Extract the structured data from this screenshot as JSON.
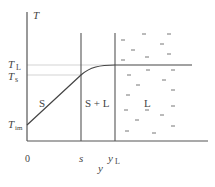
{
  "diagram": {
    "axes": {
      "y_axis_label": "T",
      "x_axis_label": "y",
      "origin_label": "0"
    },
    "y_ticks": [
      {
        "main": "T",
        "sub": "L",
        "meaning": "liquidus temperature"
      },
      {
        "main": "T",
        "sub": "s",
        "meaning": "solidus temperature"
      },
      {
        "main": "T",
        "sub": "im",
        "meaning": "initial/interface temperature"
      }
    ],
    "x_ticks": [
      {
        "main": "s",
        "sub": ""
      },
      {
        "main": "y",
        "sub": "L"
      }
    ],
    "regions": [
      {
        "label": "S",
        "meaning": "solid"
      },
      {
        "label": "S + L",
        "meaning": "mushy zone"
      },
      {
        "label": "L",
        "meaning": "liquid"
      }
    ],
    "colors": {
      "axis": "#555555",
      "guide": "#bbbbbb",
      "curve": "#444444",
      "dash": "#666666"
    }
  }
}
